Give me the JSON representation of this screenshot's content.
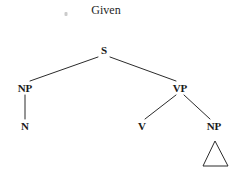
{
  "diagram": {
    "title": "Given",
    "title_position": {
      "x": 106,
      "y": 10
    },
    "background_color": "#ffffff",
    "line_color": "#2b2b2b",
    "text_color": "#1a1a1a",
    "width": 240,
    "height": 169,
    "nodes": [
      {
        "id": "s",
        "label": "S",
        "x": 104,
        "y": 50
      },
      {
        "id": "np-subj",
        "label": "NP",
        "x": 25,
        "y": 88
      },
      {
        "id": "vp",
        "label": "VP",
        "x": 180,
        "y": 88
      },
      {
        "id": "n",
        "label": "N",
        "x": 25,
        "y": 126
      },
      {
        "id": "v",
        "label": "V",
        "x": 142,
        "y": 126
      },
      {
        "id": "np-obj",
        "label": "NP",
        "x": 214,
        "y": 126
      }
    ],
    "edges": [
      {
        "from": "s",
        "to": "np-subj",
        "x1": 98,
        "y1": 57,
        "x2": 30,
        "y2": 81
      },
      {
        "from": "s",
        "to": "vp",
        "x1": 110,
        "y1": 57,
        "x2": 176,
        "y2": 81
      },
      {
        "from": "np-subj",
        "to": "n",
        "x1": 25,
        "y1": 95,
        "x2": 25,
        "y2": 119
      },
      {
        "from": "vp",
        "to": "v",
        "x1": 176,
        "y1": 95,
        "x2": 145,
        "y2": 119
      },
      {
        "from": "vp",
        "to": "np-obj",
        "x1": 184,
        "y1": 95,
        "x2": 210,
        "y2": 119
      }
    ],
    "triangle": {
      "attached_to": "np-obj",
      "apex": {
        "x": 215,
        "y": 141
      },
      "base_left": {
        "x": 203,
        "y": 166
      },
      "base_right": {
        "x": 228,
        "y": 166
      },
      "filled": false
    },
    "artifacts": [
      {
        "id": "speck",
        "x": 66,
        "y": 14
      }
    ]
  }
}
